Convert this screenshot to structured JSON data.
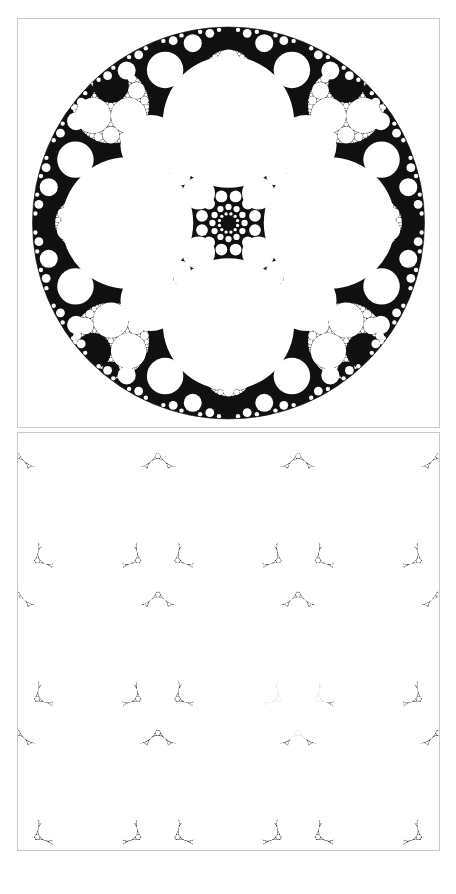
{
  "page": {
    "background_color": "#ffffff",
    "width": 456,
    "height": 894,
    "header_text": "",
    "header_color": "#fdfdfd"
  },
  "panels": [
    {
      "id": "panel-disk",
      "name": "poincare-disk-panel",
      "model": "Poincare disk",
      "x": 17,
      "y": 18,
      "width": 423,
      "height": 410,
      "border_color": "#c9c9c9",
      "background_color": "#ffffff",
      "ink_color": "#101010",
      "caption": "",
      "disk": {
        "center_x": 228,
        "center_y": 223,
        "radius": 197,
        "outline_color": "#1a1a1a"
      },
      "structure": {
        "type": "apollonian-gasket-disk",
        "symmetry_order": 4,
        "large_holes": 4,
        "dark_accumulation_points": 13,
        "recursion_depth": 7
      }
    },
    {
      "id": "panel-halfplane",
      "name": "half-plane-panel",
      "model": "Upper half-plane / periodic strip",
      "x": 17,
      "y": 432,
      "width": 423,
      "height": 419,
      "border_color": "#c9c9c9",
      "background_color": "#ffffff",
      "ink_color": "#101010",
      "caption": "",
      "structure": {
        "type": "apollonian-gasket-periodic",
        "lattice_columns": 4,
        "lattice_rows": 5,
        "recursion_depth": 7,
        "has_faded_region": true,
        "faded_region_opacity": 0.1
      }
    }
  ],
  "chart_data": {
    "type": "scatter",
    "xlabel": "",
    "ylabel": "",
    "series": [
      {
        "name": "poincare-disk-packing",
        "model": "disk",
        "circles": [
          {
            "cx": 0.0,
            "cy": -0.52,
            "r": 0.345,
            "role": "primary-hole"
          },
          {
            "cx": 0.0,
            "cy": 0.52,
            "r": 0.345,
            "role": "primary-hole"
          },
          {
            "cx": -0.52,
            "cy": 0.0,
            "r": 0.345,
            "role": "primary-hole"
          },
          {
            "cx": 0.52,
            "cy": 0.0,
            "r": 0.345,
            "role": "primary-hole"
          },
          {
            "cx": 0.0,
            "cy": 0.0,
            "r": 0.0,
            "role": "center-accumulation"
          }
        ],
        "accumulation_points": [
          {
            "cx": 0.0,
            "cy": 0.0
          },
          {
            "cx": -0.46,
            "cy": -0.46
          },
          {
            "cx": 0.46,
            "cy": -0.46
          },
          {
            "cx": -0.46,
            "cy": 0.46
          },
          {
            "cx": 0.46,
            "cy": 0.46
          }
        ]
      },
      {
        "name": "periodic-strip-packing",
        "model": "half-plane",
        "lattice_spacing_x": 0.25,
        "lattice_spacing_y": 0.2,
        "circle_radius": 0.115
      }
    ],
    "legend": [],
    "grid": false,
    "axis_visible": false
  },
  "colors": {
    "ink": "#101010",
    "paper": "#ffffff",
    "panel_border": "#c9c9c9",
    "faint": "#f7f7f7"
  }
}
